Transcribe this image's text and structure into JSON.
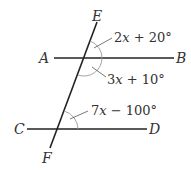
{
  "diagram": {
    "type": "parallel-lines-with-transversal",
    "points": {
      "A": "A",
      "B": "B",
      "C": "C",
      "D": "D",
      "E": "E",
      "F": "F"
    },
    "angles": [
      {
        "label": "2x + 20°",
        "x_var": "x",
        "rest": " + 20°",
        "coef": "2",
        "position": "above AB, right of transversal"
      },
      {
        "label": "3x + 10°",
        "x_var": "x",
        "rest": " + 10°",
        "coef": "3",
        "position": "below AB, right of transversal"
      },
      {
        "label": "7x − 100°",
        "x_var": "x",
        "rest": " − 100°",
        "coef": "7",
        "position": "above CD, right of transversal"
      }
    ],
    "colors": {
      "line": "#222222",
      "arc": "#999999",
      "text": "#333333"
    }
  }
}
